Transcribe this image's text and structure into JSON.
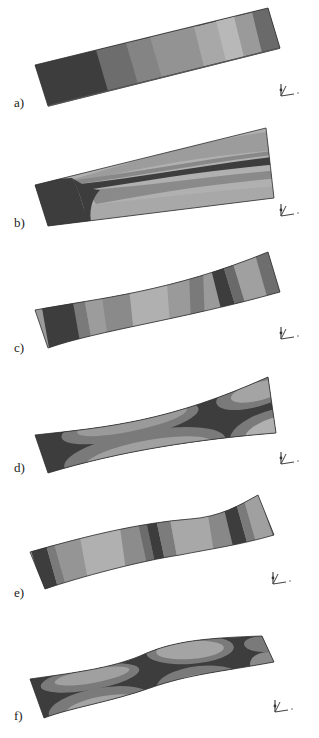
{
  "figure": {
    "panels": [
      {
        "label": "a)",
        "mode": "first torsional / bending gradient"
      },
      {
        "label": "b)",
        "mode": "lateral bending with central band"
      },
      {
        "label": "c)",
        "mode": "second bending"
      },
      {
        "label": "d)",
        "mode": "torsion-bending with lobes"
      },
      {
        "label": "e)",
        "mode": "third bending (S-shape)"
      },
      {
        "label": "f)",
        "mode": "higher torsion-bending with lobes"
      }
    ],
    "axis_triad_labels": {
      "x": "x",
      "y": "y",
      "z": "z"
    }
  },
  "colors": {
    "darkest": "#3a3a3a",
    "dark": "#5a5a5a",
    "mid_dark": "#767676",
    "mid": "#8e8e8e",
    "mid_light": "#a4a4a4",
    "light": "#b6b6b6",
    "edge": "#2e2e2e"
  }
}
